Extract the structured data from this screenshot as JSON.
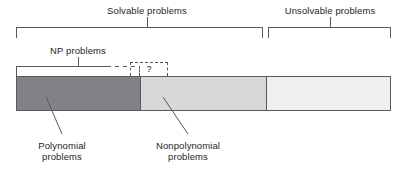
{
  "figure": {
    "background_color": "#ffffff",
    "line_color": "#58595b",
    "text_color": "#231f20"
  },
  "top_brackets": [
    {
      "label": "Solvable problems",
      "label_x": 147,
      "label_y": 5,
      "left": 16,
      "right": 263,
      "tick_x": 147,
      "top": 27,
      "height": 11
    },
    {
      "label": "Unsolvable problems",
      "label_x": 330,
      "label_y": 5,
      "left": 268,
      "right": 391,
      "tick_x": 330,
      "top": 27,
      "height": 11
    }
  ],
  "np_bracket": {
    "label": "NP problems",
    "label_x": 78,
    "label_y": 45,
    "left": 16,
    "solid_right": 106,
    "dashed_right": 140,
    "tick_x": 78,
    "top": 66,
    "height": 10
  },
  "question_box": {
    "mark": "?",
    "left": 130,
    "right": 168,
    "top": 62,
    "height": 14
  },
  "bar": {
    "left": 16,
    "top": 76,
    "width": 375,
    "height": 35,
    "segments": [
      {
        "name": "polynomial-problems",
        "color": "#808285",
        "width_pct": 33.1
      },
      {
        "name": "nonpolynomial-problems",
        "color": "#d7d8da",
        "width_pct": 33.7
      },
      {
        "name": "unsolvable-problems",
        "color": "#eeeff0",
        "width_pct": 33.2
      }
    ]
  },
  "callouts": [
    {
      "label_line1": "Polynomial",
      "label_line2": "problems",
      "label_x": 62,
      "label_y": 140,
      "leader_x1": 46,
      "leader_y1": 97,
      "leader_x2": 62,
      "leader_y2": 134
    },
    {
      "label_line1": "Nonpolynomial",
      "label_line2": "problems",
      "label_x": 188,
      "label_y": 140,
      "leader_x1": 163,
      "leader_y1": 97,
      "leader_x2": 188,
      "leader_y2": 134
    }
  ]
}
